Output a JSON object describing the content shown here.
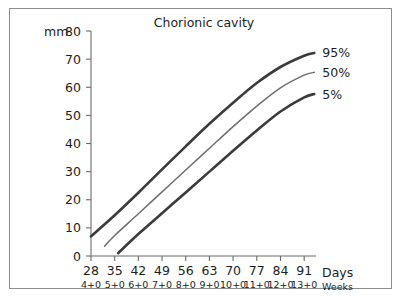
{
  "chart_data": {
    "type": "line",
    "title": "Chorionic cavity",
    "xlabel": "Days",
    "xlabel2": "Weeks",
    "ylabel": "mm",
    "xlim": [
      28,
      94.5
    ],
    "ylim": [
      0,
      80
    ],
    "grid": false,
    "legend_position": "right-of-lines",
    "x_ticks": [
      28,
      35,
      42,
      49,
      56,
      63,
      70,
      77,
      84,
      91
    ],
    "x_tick_labels": [
      "28",
      "35",
      "42",
      "49",
      "56",
      "63",
      "70",
      "77",
      "84",
      "91"
    ],
    "x_tick_labels_secondary": [
      "4+0",
      "5+0",
      "6+0",
      "7+0",
      "8+0",
      "9+0",
      "10+0",
      "11+0",
      "12+0",
      "13+0"
    ],
    "y_ticks": [
      0,
      10,
      20,
      30,
      40,
      50,
      60,
      70,
      80
    ],
    "y_tick_labels": [
      "0",
      "10",
      "20",
      "30",
      "40",
      "50",
      "60",
      "70",
      "80"
    ],
    "series": [
      {
        "name": "95%",
        "label": "95%",
        "color": "#3b3b3b",
        "width": 2.6,
        "x": [
          28,
          35,
          42,
          49,
          56,
          63,
          70,
          77,
          84,
          91,
          94
        ],
        "values": [
          7.0,
          14.5,
          22.5,
          30.8,
          39.0,
          47.0,
          54.5,
          61.5,
          67.2,
          71.2,
          72.2
        ]
      },
      {
        "name": "50%",
        "label": "50%",
        "color": "#6e6e6e",
        "width": 1.5,
        "x": [
          32,
          35,
          42,
          49,
          56,
          63,
          70,
          77,
          84,
          91,
          94
        ],
        "values": [
          3.5,
          7.3,
          15.0,
          22.8,
          30.6,
          38.3,
          46.0,
          53.3,
          59.8,
          64.3,
          65.3
        ]
      },
      {
        "name": "5%",
        "label": "5%",
        "color": "#3b3b3b",
        "width": 2.6,
        "x": [
          36,
          42,
          49,
          56,
          63,
          70,
          77,
          84,
          91,
          94
        ],
        "values": [
          1.0,
          7.8,
          15.2,
          22.6,
          30.0,
          37.4,
          44.6,
          51.4,
          56.4,
          57.6
        ]
      }
    ]
  },
  "axes": {
    "unit_label": "mm",
    "days_label": "Days",
    "weeks_label": "Weeks"
  },
  "colors": {
    "frame_border": "#8d8d8d",
    "axis": "#6b6b6b",
    "text": "#1d1d1d",
    "background": "#ffffff"
  }
}
